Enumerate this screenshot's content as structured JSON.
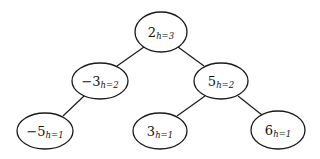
{
  "diagram": {
    "type": "binary-tree",
    "nodes": [
      {
        "id": "n2",
        "value": "2",
        "height_label": "h=3",
        "cx": 161,
        "cy": 32,
        "rx": 26,
        "ry": 20
      },
      {
        "id": "nm3",
        "value": "−3",
        "height_label": "h=2",
        "cx": 100,
        "cy": 81,
        "rx": 28,
        "ry": 18
      },
      {
        "id": "n5",
        "value": "5",
        "height_label": "h=2",
        "cx": 221,
        "cy": 81,
        "rx": 27,
        "ry": 18
      },
      {
        "id": "nm5",
        "value": "−5",
        "height_label": "h=1",
        "cx": 45,
        "cy": 131,
        "rx": 28,
        "ry": 18
      },
      {
        "id": "n3",
        "value": "3",
        "height_label": "h=1",
        "cx": 160,
        "cy": 131,
        "rx": 27,
        "ry": 18
      },
      {
        "id": "n6",
        "value": "6",
        "height_label": "h=1",
        "cx": 278,
        "cy": 130,
        "rx": 27,
        "ry": 19
      }
    ],
    "edges": [
      {
        "from": "n2",
        "to": "nm3"
      },
      {
        "from": "n2",
        "to": "n5"
      },
      {
        "from": "nm3",
        "to": "nm5"
      },
      {
        "from": "n5",
        "to": "n3"
      },
      {
        "from": "n5",
        "to": "n6"
      }
    ]
  }
}
